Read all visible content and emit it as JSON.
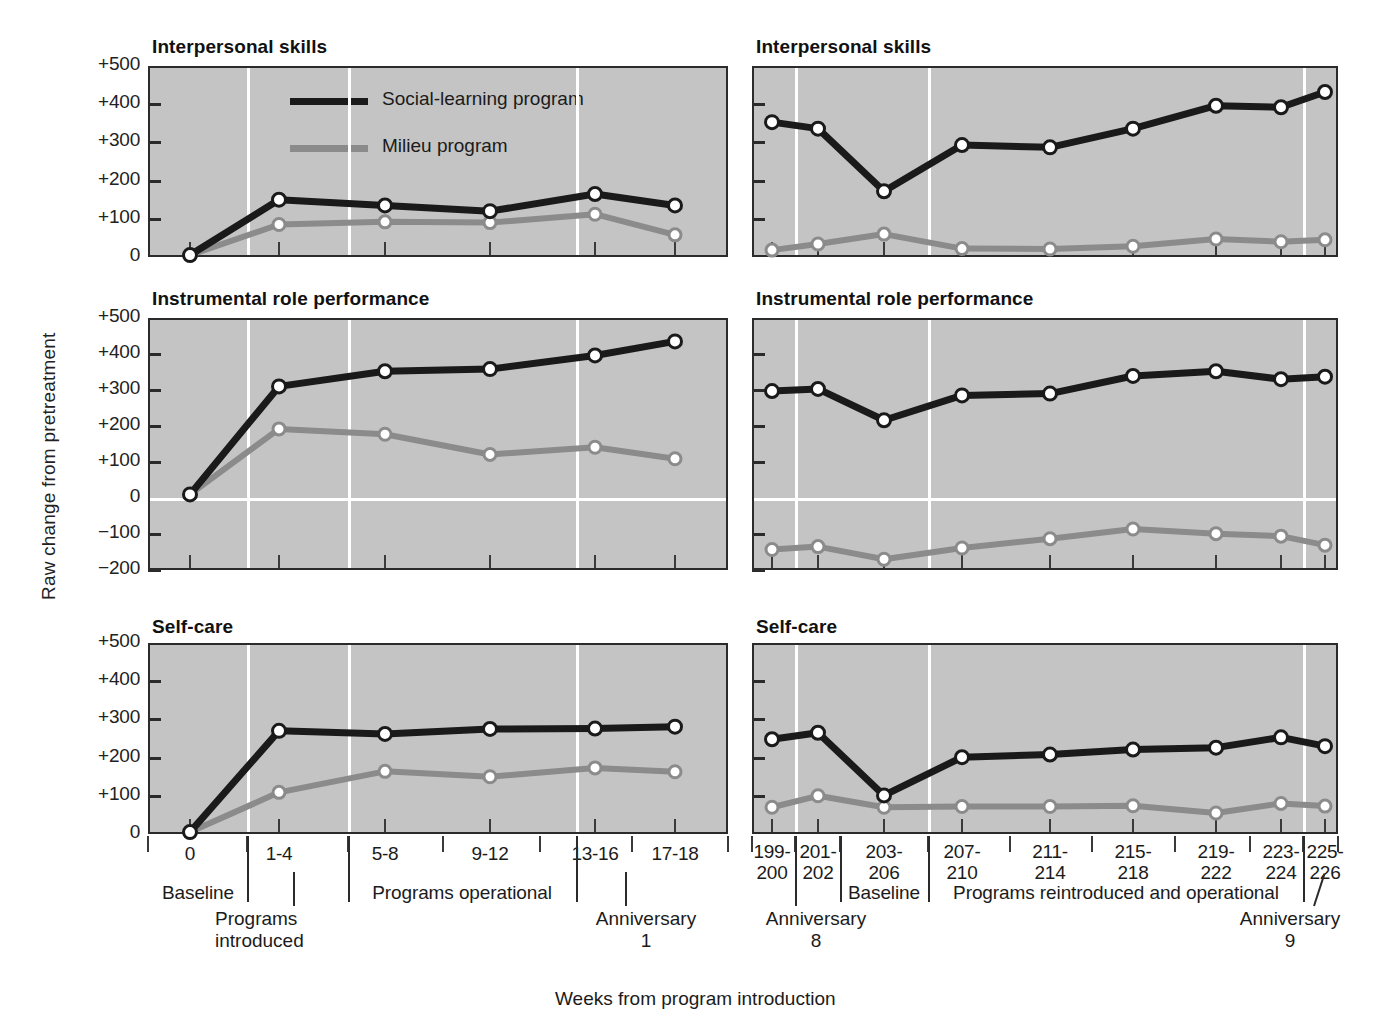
{
  "figure": {
    "ylabel": "Raw change from pretreatment",
    "caption": "Weeks from program introduction"
  },
  "legend": {
    "items": [
      {
        "label": "Social-learning program",
        "color": "#1a1a1a",
        "key": "social_learning"
      },
      {
        "label": "Milieu program",
        "color": "#8b8b8b",
        "key": "milieu"
      }
    ]
  },
  "left": {
    "titles": {
      "p1": "Interpersonal skills",
      "p2": "Instrumental role performance",
      "p3": "Self-care"
    },
    "ytick_labels_full": [
      "+500",
      "+400",
      "+300",
      "+200",
      "+100",
      "0",
      "−100",
      "−200"
    ],
    "ytick_labels_short": [
      "+500",
      "+400",
      "+300",
      "+200",
      "+100",
      "0"
    ],
    "categories": [
      "0",
      "1-4",
      "5-8",
      "9-12",
      "13-16",
      "17-18"
    ],
    "segments": [
      {
        "label": "Baseline"
      },
      {
        "label": "Programs operational"
      }
    ],
    "annotations": [
      {
        "label_line1": "Programs",
        "label_line2": "introduced"
      },
      {
        "label_line1": "Anniversary",
        "label_line2": "1"
      }
    ]
  },
  "right": {
    "titles": {
      "p1": "Interpersonal skills",
      "p2": "Instrumental role performance",
      "p3": "Self-care"
    },
    "categories": [
      {
        "top": "199-",
        "bottom": "200"
      },
      {
        "top": "201-",
        "bottom": "202"
      },
      {
        "top": "203-",
        "bottom": "206"
      },
      {
        "top": "207-",
        "bottom": "210"
      },
      {
        "top": "211-",
        "bottom": "214"
      },
      {
        "top": "215-",
        "bottom": "218"
      },
      {
        "top": "219-",
        "bottom": "222"
      },
      {
        "top": "223-",
        "bottom": "224"
      },
      {
        "top": "225-",
        "bottom": "226"
      }
    ],
    "segments": [
      {
        "label": "Baseline"
      },
      {
        "label": "Programs reintroduced and operational"
      }
    ],
    "annotations": [
      {
        "label_line1": "Anniversary",
        "label_line2": "8"
      },
      {
        "label_line1": "Anniversary",
        "label_line2": "9"
      }
    ]
  },
  "chart_data": [
    {
      "type": "line",
      "title": "Interpersonal skills",
      "panel": "left",
      "xlabel": "Weeks from program introduction",
      "ylabel": "Raw change from pretreatment",
      "ylim": [
        0,
        500
      ],
      "yticks": [
        0,
        100,
        200,
        300,
        400,
        500
      ],
      "categories": [
        "0",
        "1-4",
        "5-8",
        "9-12",
        "13-16",
        "17-18"
      ],
      "series": [
        {
          "name": "Social-learning program",
          "values": [
            5,
            150,
            135,
            120,
            165,
            135
          ]
        },
        {
          "name": "Milieu program",
          "values": [
            5,
            85,
            92,
            90,
            112,
            58
          ]
        }
      ]
    },
    {
      "type": "line",
      "title": "Instrumental role performance",
      "panel": "left",
      "ylim": [
        -200,
        500
      ],
      "yticks": [
        -200,
        -100,
        0,
        100,
        200,
        300,
        400,
        500
      ],
      "categories": [
        "0",
        "1-4",
        "5-8",
        "9-12",
        "13-16",
        "17-18"
      ],
      "series": [
        {
          "name": "Social-learning program",
          "values": [
            10,
            310,
            352,
            358,
            396,
            435
          ]
        },
        {
          "name": "Milieu program",
          "values": [
            10,
            192,
            177,
            121,
            141,
            109
          ]
        }
      ]
    },
    {
      "type": "line",
      "title": "Self-care",
      "panel": "left",
      "ylim": [
        0,
        500
      ],
      "yticks": [
        0,
        100,
        200,
        300,
        400,
        500
      ],
      "categories": [
        "0",
        "1-4",
        "5-8",
        "9-12",
        "13-16",
        "17-18"
      ],
      "series": [
        {
          "name": "Social-learning program",
          "values": [
            5,
            270,
            262,
            275,
            276,
            281
          ]
        },
        {
          "name": "Milieu program",
          "values": [
            5,
            109,
            164,
            150,
            173,
            163
          ]
        }
      ]
    },
    {
      "type": "line",
      "title": "Interpersonal skills",
      "panel": "right",
      "ylim": [
        0,
        500
      ],
      "yticks": [
        0,
        100,
        200,
        300,
        400,
        500
      ],
      "categories": [
        "199-200",
        "201-202",
        "203-206",
        "207-210",
        "211-214",
        "215-218",
        "219-222",
        "223-224",
        "225-226"
      ],
      "series": [
        {
          "name": "Social-learning program",
          "values": [
            353,
            336,
            172,
            293,
            287,
            336,
            396,
            392,
            432
          ]
        },
        {
          "name": "Milieu program",
          "values": [
            18,
            34,
            60,
            22,
            21,
            28,
            47,
            40,
            45
          ]
        }
      ]
    },
    {
      "type": "line",
      "title": "Instrumental role performance",
      "panel": "right",
      "ylim": [
        -200,
        500
      ],
      "yticks": [
        -200,
        -100,
        0,
        100,
        200,
        300,
        400,
        500
      ],
      "categories": [
        "199-200",
        "201-202",
        "203-206",
        "207-210",
        "211-214",
        "215-218",
        "219-222",
        "223-224",
        "225-226"
      ],
      "series": [
        {
          "name": "Social-learning program",
          "values": [
            297,
            303,
            216,
            285,
            290,
            339,
            352,
            330,
            337
          ]
        },
        {
          "name": "Milieu program",
          "values": [
            -143,
            -135,
            -170,
            -139,
            -113,
            -86,
            -99,
            -106,
            -131
          ]
        }
      ]
    },
    {
      "type": "line",
      "title": "Self-care",
      "panel": "right",
      "ylim": [
        0,
        500
      ],
      "yticks": [
        0,
        100,
        200,
        300,
        400,
        500
      ],
      "categories": [
        "199-200",
        "201-202",
        "203-206",
        "207-210",
        "211-214",
        "215-218",
        "219-222",
        "223-224",
        "225-226"
      ],
      "series": [
        {
          "name": "Social-learning program",
          "values": [
            248,
            265,
            101,
            201,
            208,
            221,
            226,
            253,
            230
          ]
        },
        {
          "name": "Milieu program",
          "values": [
            70,
            100,
            70,
            72,
            72,
            74,
            55,
            80,
            73
          ]
        }
      ]
    }
  ]
}
